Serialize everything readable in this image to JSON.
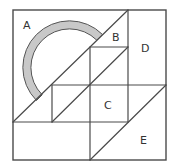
{
  "diagram": {
    "colors": {
      "line": "#4a4a4a",
      "ring_fill": "#c8c8c8",
      "ring_stroke": "#555555",
      "label": "#333333",
      "background": "#ffffff"
    },
    "labels": {
      "A": "A",
      "B": "B",
      "C": "C",
      "D": "D",
      "E": "E"
    },
    "label_positions": {
      "A": [
        23,
        29
      ],
      "B": [
        112,
        41
      ],
      "C": [
        104,
        109
      ],
      "D": [
        141,
        52
      ],
      "E": [
        140,
        144
      ]
    },
    "regions": [
      {
        "id": "A",
        "description": "upper-left triangle region above main diagonal, contains shaded half-ring"
      },
      {
        "id": "B",
        "description": "small triangle between main diagonal, vertical line x=128 and horizontal line y=47"
      },
      {
        "id": "C",
        "description": "central square region bounded by x=90..128, y=85..122"
      },
      {
        "id": "D",
        "description": "upper-right rectangular column x=128..166, y=10..85"
      },
      {
        "id": "E",
        "description": "lower-right triangle below diagonal from (166,85) to (90,160)"
      }
    ]
  }
}
